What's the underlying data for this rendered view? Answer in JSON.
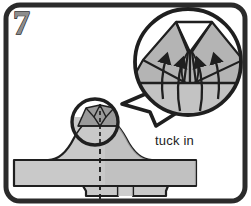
{
  "figure": {
    "kind": "instruction-diagram",
    "step_number": "7",
    "caption": "tuck in",
    "background_color": "#ffffff",
    "ink_color": "#1f1f1f",
    "fill_light": "#c9c9c9",
    "fill_mid": "#b4b4b4",
    "fill_dark": "#9a9a9a",
    "frame": {
      "name": "rounded-panel-border",
      "stroke_color": "#2b2b2b",
      "stroke_width": "5",
      "corner_radius": "14"
    },
    "main_shape": {
      "name": "folded-garment-silhouette",
      "fill": "#c9c9c9",
      "outline": "#1f1f1f",
      "center_line_style": "dashed",
      "center_line_color": "#1f1f1f"
    },
    "detail_circle": {
      "name": "zoom-source-circle",
      "cx": "95",
      "cy": "122",
      "r": "23",
      "stroke_color": "#1f1f1f"
    },
    "callout_bubble": {
      "name": "magnified-detail-bubble",
      "cx": "188",
      "cy": "62",
      "r": "53",
      "stroke_color": "#1f1f1f",
      "fill": "#ffffff",
      "tail_direction": "down-left"
    },
    "arrows": {
      "name": "tuck-direction-arrows",
      "count": "4",
      "direction": "up",
      "color": "#1f1f1f"
    }
  }
}
